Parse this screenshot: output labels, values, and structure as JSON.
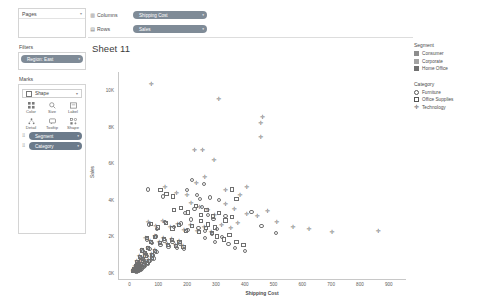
{
  "sidebar": {
    "pages": {
      "title": "Pages",
      "collapse_icon": "chevron-down-icon"
    },
    "filters": {
      "title": "Filters",
      "pills": [
        {
          "label": "Region: East",
          "caret": "▾"
        }
      ]
    },
    "marks": {
      "title": "Marks",
      "mark_type": {
        "value": "Shape",
        "caret": "▾",
        "icon": "shape-icon"
      },
      "buttons": [
        {
          "label": "Color",
          "icon": "color-grid-icon"
        },
        {
          "label": "Size",
          "icon": "size-icon"
        },
        {
          "label": "Label",
          "icon": "label-icon"
        },
        {
          "label": "Detail",
          "icon": "detail-icon"
        },
        {
          "label": "Tooltip",
          "icon": "tooltip-icon"
        },
        {
          "label": "Shape",
          "icon": "shape-icon"
        }
      ],
      "encodings": [
        {
          "label": "Segment",
          "grip": "⠿",
          "caret": "▾"
        },
        {
          "label": "Category",
          "grip": "⠿",
          "caret": "▾"
        }
      ]
    }
  },
  "shelves": [
    {
      "name": "Columns",
      "icon": "columns-icon",
      "pill": "Shipping Cost",
      "caret": "▾"
    },
    {
      "name": "Rows",
      "icon": "rows-icon",
      "pill": "Sales",
      "caret": "▾"
    }
  ],
  "sheet": {
    "title": "Sheet 11"
  },
  "legend": {
    "segment": {
      "title": "Segment",
      "items": [
        {
          "label": "Consumer",
          "color": "#8d8d8d"
        },
        {
          "label": "Corporate",
          "color": "#a3a3a3"
        },
        {
          "label": "Home Office",
          "color": "#707070"
        }
      ]
    },
    "category": {
      "title": "Category",
      "items": [
        {
          "label": "Furniture",
          "shape": "circle"
        },
        {
          "label": "Office Supplies",
          "shape": "square"
        },
        {
          "label": "Technology",
          "shape": "plus"
        }
      ]
    }
  },
  "chart_data": {
    "type": "scatter",
    "title": "Sheet 11",
    "xlabel": "Shipping Cost",
    "ylabel": "Sales",
    "xlim": [
      -40,
      960
    ],
    "ylim": [
      -400,
      11000
    ],
    "xticks": [
      0,
      100,
      200,
      300,
      400,
      500,
      600,
      700,
      800,
      900
    ],
    "xticklabels": [
      "0",
      "100",
      "200",
      "300",
      "400",
      "500",
      "600",
      "700",
      "800",
      "900"
    ],
    "yticks": [
      0,
      2000,
      4000,
      6000,
      8000,
      10000
    ],
    "yticklabels": [
      "0K",
      "2K",
      "4K",
      "6K",
      "8K",
      "10K"
    ],
    "grid": false,
    "legend_position": "right",
    "series": [
      {
        "name": "Furniture",
        "shape": "circle",
        "points": [
          [
            62,
            4560
          ],
          [
            112,
            4180
          ],
          [
            196,
            4540
          ],
          [
            241,
            4020
          ],
          [
            214,
            5060
          ],
          [
            255,
            4880
          ],
          [
            231,
            4260
          ],
          [
            276,
            4120
          ],
          [
            306,
            3980
          ],
          [
            330,
            3120
          ],
          [
            420,
            3340
          ],
          [
            455,
            2560
          ],
          [
            505,
            2180
          ],
          [
            64,
            2640
          ],
          [
            92,
            2380
          ],
          [
            120,
            2800
          ],
          [
            150,
            2500
          ],
          [
            176,
            2700
          ],
          [
            198,
            2340
          ],
          [
            210,
            2920
          ],
          [
            236,
            2460
          ],
          [
            258,
            2280
          ],
          [
            284,
            2120
          ],
          [
            300,
            2400
          ],
          [
            318,
            1940
          ],
          [
            58,
            1820
          ],
          [
            74,
            1640
          ],
          [
            88,
            1980
          ],
          [
            104,
            1520
          ],
          [
            118,
            1760
          ],
          [
            132,
            1440
          ],
          [
            146,
            1680
          ],
          [
            160,
            1360
          ],
          [
            172,
            1600
          ],
          [
            186,
            1280
          ],
          [
            44,
            1180
          ],
          [
            54,
            1020
          ],
          [
            66,
            1300
          ],
          [
            78,
            940
          ],
          [
            90,
            1140
          ],
          [
            36,
            820
          ],
          [
            46,
            700
          ],
          [
            56,
            900
          ],
          [
            68,
            620
          ],
          [
            80,
            780
          ],
          [
            28,
            540
          ],
          [
            34,
            440
          ],
          [
            42,
            600
          ],
          [
            50,
            380
          ],
          [
            60,
            500
          ],
          [
            22,
            320
          ],
          [
            26,
            260
          ],
          [
            32,
            380
          ],
          [
            38,
            220
          ],
          [
            45,
            300
          ],
          [
            16,
            180
          ],
          [
            19,
            140
          ],
          [
            24,
            200
          ],
          [
            29,
            120
          ],
          [
            35,
            160
          ],
          [
            12,
            100
          ],
          [
            14,
            80
          ],
          [
            18,
            110
          ],
          [
            21,
            70
          ],
          [
            25,
            90
          ],
          [
            260,
            1900
          ],
          [
            292,
            1700
          ],
          [
            340,
            1560
          ],
          [
            362,
            1340
          ],
          [
            398,
            1180
          ],
          [
            190,
            3260
          ],
          [
            222,
            3480
          ],
          [
            248,
            3600
          ],
          [
            268,
            3180
          ],
          [
            288,
            2960
          ]
        ]
      },
      {
        "name": "Office Supplies",
        "shape": "square",
        "points": [
          [
            104,
            4520
          ],
          [
            125,
            4300
          ],
          [
            148,
            4180
          ],
          [
            352,
            4560
          ],
          [
            368,
            4020
          ],
          [
            152,
            3420
          ],
          [
            176,
            3560
          ],
          [
            200,
            3300
          ],
          [
            226,
            3660
          ],
          [
            244,
            3180
          ],
          [
            264,
            3420
          ],
          [
            286,
            3080
          ],
          [
            306,
            3260
          ],
          [
            330,
            2860
          ],
          [
            352,
            3040
          ],
          [
            70,
            2660
          ],
          [
            96,
            2480
          ],
          [
            122,
            2740
          ],
          [
            146,
            2420
          ],
          [
            168,
            2620
          ],
          [
            192,
            2300
          ],
          [
            214,
            2540
          ],
          [
            238,
            2240
          ],
          [
            262,
            2460
          ],
          [
            284,
            2160
          ],
          [
            56,
            1880
          ],
          [
            72,
            1700
          ],
          [
            86,
            1960
          ],
          [
            102,
            1620
          ],
          [
            116,
            1840
          ],
          [
            130,
            1540
          ],
          [
            144,
            1780
          ],
          [
            158,
            1460
          ],
          [
            170,
            1700
          ],
          [
            184,
            1400
          ],
          [
            40,
            1220
          ],
          [
            50,
            1060
          ],
          [
            62,
            1340
          ],
          [
            74,
            980
          ],
          [
            86,
            1180
          ],
          [
            32,
            860
          ],
          [
            42,
            740
          ],
          [
            52,
            940
          ],
          [
            64,
            660
          ],
          [
            76,
            820
          ],
          [
            24,
            580
          ],
          [
            30,
            480
          ],
          [
            38,
            640
          ],
          [
            46,
            420
          ],
          [
            56,
            540
          ],
          [
            18,
            340
          ],
          [
            22,
            280
          ],
          [
            28,
            400
          ],
          [
            34,
            240
          ],
          [
            40,
            320
          ],
          [
            13,
            190
          ],
          [
            16,
            150
          ],
          [
            20,
            210
          ],
          [
            24,
            130
          ],
          [
            30,
            170
          ],
          [
            10,
            110
          ],
          [
            12,
            85
          ],
          [
            15,
            120
          ],
          [
            18,
            75
          ],
          [
            22,
            95
          ],
          [
            300,
            1980
          ],
          [
            326,
            1820
          ],
          [
            344,
            2060
          ],
          [
            368,
            1680
          ],
          [
            392,
            1500
          ],
          [
            246,
            2820
          ],
          [
            268,
            2640
          ],
          [
            294,
            2480
          ]
        ]
      },
      {
        "name": "Technology",
        "shape": "plus",
        "points": [
          [
            72,
            10350
          ],
          [
            306,
            9540
          ],
          [
            458,
            8540
          ],
          [
            452,
            8180
          ],
          [
            452,
            7420
          ],
          [
            222,
            6700
          ],
          [
            250,
            6720
          ],
          [
            290,
            6180
          ],
          [
            258,
            5260
          ],
          [
            228,
            4900
          ],
          [
            330,
            4520
          ],
          [
            380,
            4260
          ],
          [
            404,
            4720
          ],
          [
            330,
            3760
          ],
          [
            360,
            3500
          ],
          [
            404,
            3240
          ],
          [
            440,
            3100
          ],
          [
            476,
            3380
          ],
          [
            508,
            2760
          ],
          [
            564,
            2520
          ],
          [
            620,
            2420
          ],
          [
            700,
            2240
          ],
          [
            860,
            2280
          ],
          [
            120,
            4700
          ],
          [
            160,
            4380
          ],
          [
            196,
            4260
          ],
          [
            210,
            3840
          ],
          [
            240,
            3620
          ],
          [
            268,
            3420
          ],
          [
            292,
            3180
          ],
          [
            62,
            2760
          ],
          [
            88,
            2560
          ],
          [
            112,
            2820
          ],
          [
            138,
            2480
          ],
          [
            164,
            2680
          ],
          [
            186,
            2360
          ],
          [
            208,
            2600
          ],
          [
            232,
            2300
          ],
          [
            256,
            2520
          ],
          [
            280,
            2220
          ],
          [
            52,
            1920
          ],
          [
            68,
            1740
          ],
          [
            84,
            2000
          ],
          [
            100,
            1660
          ],
          [
            114,
            1880
          ],
          [
            128,
            1580
          ],
          [
            142,
            1820
          ],
          [
            156,
            1500
          ],
          [
            168,
            1740
          ],
          [
            182,
            1440
          ],
          [
            38,
            1260
          ],
          [
            48,
            1100
          ],
          [
            60,
            1380
          ],
          [
            72,
            1020
          ],
          [
            84,
            1220
          ],
          [
            30,
            900
          ],
          [
            40,
            780
          ],
          [
            50,
            980
          ],
          [
            62,
            700
          ],
          [
            74,
            860
          ],
          [
            22,
            620
          ],
          [
            28,
            520
          ],
          [
            36,
            680
          ],
          [
            44,
            460
          ],
          [
            54,
            580
          ],
          [
            16,
            360
          ],
          [
            20,
            300
          ],
          [
            26,
            420
          ],
          [
            32,
            260
          ],
          [
            38,
            340
          ],
          [
            11,
            200
          ],
          [
            14,
            160
          ],
          [
            18,
            220
          ],
          [
            22,
            140
          ],
          [
            28,
            180
          ],
          [
            9,
            115
          ],
          [
            11,
            90
          ],
          [
            14,
            125
          ],
          [
            17,
            80
          ],
          [
            20,
            100
          ],
          [
            316,
            2640
          ],
          [
            348,
            2460
          ],
          [
            372,
            2700
          ]
        ]
      }
    ]
  }
}
